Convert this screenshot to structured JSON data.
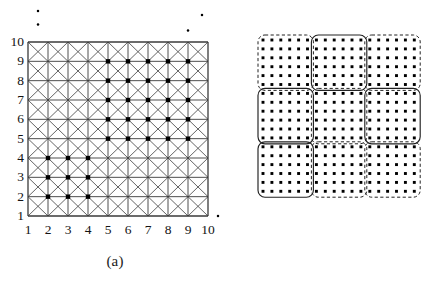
{
  "figure": {
    "panels": [
      {
        "id": "a",
        "caption": "(a)"
      },
      {
        "id": "b",
        "caption": "(b)"
      }
    ]
  },
  "panel_a": {
    "caption": "(a)",
    "y_axis_labels": [
      "10",
      "9",
      "8",
      "7",
      "6",
      "5",
      "4",
      "3",
      "2",
      "1"
    ],
    "x_axis_labels": [
      "1",
      "2",
      "3",
      "4",
      "5",
      "6",
      "7",
      "8",
      "9",
      "10"
    ]
  },
  "panel_b": {
    "caption": "(b)"
  },
  "colors": {
    "ink": "#111111",
    "grid_line": "#3a3a3a",
    "grid_diagonal": "#4a4a4a",
    "marker": "#000000",
    "cluster_outline": "#222222",
    "background": "#ffffff"
  },
  "chart_data": {
    "type": "scatter",
    "title": "",
    "xlabel": "",
    "ylabel": "",
    "panels": [
      {
        "id": "a",
        "caption": "(a)",
        "type": "scatter",
        "description": "Triangulated 10x10 lattice grid with two marked point clusters and outlying noise points",
        "xlim": [
          1,
          10
        ],
        "ylim": [
          1,
          10
        ],
        "xticks": [
          1,
          2,
          3,
          4,
          5,
          6,
          7,
          8,
          9,
          10
        ],
        "yticks": [
          1,
          2,
          3,
          4,
          5,
          6,
          7,
          8,
          9,
          10
        ],
        "grid": true,
        "grid_style": "square-with-both-diagonals",
        "series": [
          {
            "name": "cluster-1",
            "marker": "filled-square",
            "points": [
              [
                5,
                9
              ],
              [
                6,
                9
              ],
              [
                7,
                9
              ],
              [
                8,
                9
              ],
              [
                9,
                9
              ],
              [
                5,
                8
              ],
              [
                6,
                8
              ],
              [
                7,
                8
              ],
              [
                8,
                8
              ],
              [
                9,
                8
              ],
              [
                5,
                7
              ],
              [
                6,
                7
              ],
              [
                7,
                7
              ],
              [
                8,
                7
              ],
              [
                9,
                7
              ],
              [
                5,
                6
              ],
              [
                6,
                6
              ],
              [
                7,
                6
              ],
              [
                8,
                6
              ],
              [
                9,
                6
              ],
              [
                5,
                5
              ],
              [
                6,
                5
              ],
              [
                7,
                5
              ],
              [
                8,
                5
              ],
              [
                9,
                5
              ]
            ]
          },
          {
            "name": "cluster-2",
            "marker": "filled-square",
            "points": [
              [
                2,
                4
              ],
              [
                3,
                4
              ],
              [
                4,
                4
              ],
              [
                2,
                3
              ],
              [
                3,
                3
              ],
              [
                4,
                3
              ],
              [
                2,
                2
              ],
              [
                3,
                2
              ],
              [
                4,
                2
              ]
            ]
          },
          {
            "name": "noise-outliers",
            "marker": "small-dot",
            "points": [
              [
                1.5,
                11.6
              ],
              [
                1.5,
                10.9
              ],
              [
                9.7,
                11.4
              ],
              [
                9.0,
                10.6
              ],
              [
                10.5,
                1.0
              ],
              [
                11.2,
                1.0
              ]
            ]
          }
        ]
      },
      {
        "id": "b",
        "caption": "(b)",
        "type": "scatter",
        "description": "Uniform 18x18 dot lattice partitioned by overlapping rounded rectangular cluster boundaries, some dashed and some solid",
        "grid": false,
        "dot_rows": 18,
        "dot_cols": 18,
        "regions": [
          {
            "name": "region-top-left",
            "style": "dashed",
            "x": 0,
            "y": 0,
            "w": 6,
            "h": 6
          },
          {
            "name": "region-top-mid",
            "style": "solid",
            "x": 6,
            "y": 0,
            "w": 6,
            "h": 6
          },
          {
            "name": "region-top-right",
            "style": "dashed",
            "x": 12,
            "y": 0,
            "w": 6,
            "h": 6
          },
          {
            "name": "region-mid-left",
            "style": "solid",
            "x": 0,
            "y": 6,
            "w": 6,
            "h": 6
          },
          {
            "name": "region-mid-center",
            "style": "dashed",
            "x": 6,
            "y": 6,
            "w": 6,
            "h": 6
          },
          {
            "name": "region-mid-right",
            "style": "solid",
            "x": 12,
            "y": 6,
            "w": 6,
            "h": 6
          },
          {
            "name": "region-bottom-left",
            "style": "solid",
            "x": 0,
            "y": 12,
            "w": 6,
            "h": 6
          },
          {
            "name": "region-bottom-mid",
            "style": "dashed",
            "x": 6,
            "y": 12,
            "w": 6,
            "h": 6
          },
          {
            "name": "region-bottom-right",
            "style": "dashed",
            "x": 12,
            "y": 12,
            "w": 6,
            "h": 6
          }
        ]
      }
    ]
  }
}
